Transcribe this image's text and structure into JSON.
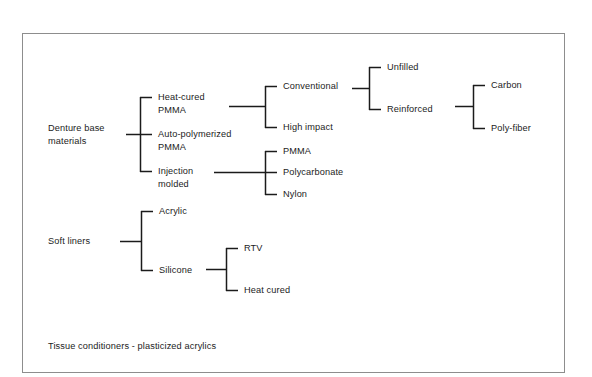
{
  "figure": {
    "background_color": "#ffffff",
    "border_color": "#8d8d8d",
    "line_color": "#1b1b1b",
    "text_color": "#1c1c1c"
  },
  "roots": {
    "denture_base": "Denture base\nmaterials",
    "denture_base_line1": "Denture base",
    "denture_base_line2": "materials",
    "soft_liners": "Soft liners"
  },
  "denture_base_children": [
    {
      "label": "Heat-cured\nPMMA",
      "line1": "Heat-cured",
      "line2": "PMMA"
    },
    {
      "label": "Auto-polymerized\nPMMA",
      "line1": "Auto-polymerized",
      "line2": "PMMA"
    },
    {
      "label": "Injection\nmolded",
      "line1": "Injection",
      "line2": "molded"
    }
  ],
  "heat_cured_children": [
    {
      "label": "Conventional"
    },
    {
      "label": "High impact"
    }
  ],
  "conventional_children": [
    {
      "label": "Unfilled"
    },
    {
      "label": "Reinforced"
    }
  ],
  "reinforced_children": [
    {
      "label": "Carbon"
    },
    {
      "label": "Poly-fiber"
    }
  ],
  "injection_molded_children": [
    {
      "label": "PMMA"
    },
    {
      "label": "Polycarbonate"
    },
    {
      "label": "Nylon"
    }
  ],
  "soft_liners_children": [
    {
      "label": "Acrylic"
    },
    {
      "label": "Silicone"
    }
  ],
  "silicone_children": [
    {
      "label": "RTV"
    },
    {
      "label": "Heat cured"
    }
  ],
  "footnote": {
    "text": "Tissue conditioners - plasticized acrylics"
  }
}
